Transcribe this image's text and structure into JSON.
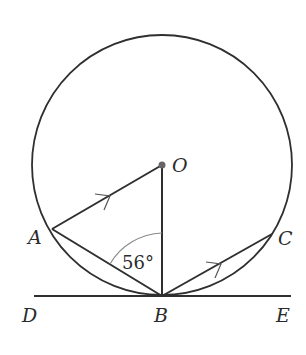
{
  "diagram": {
    "type": "circle-geometry",
    "circle": {
      "center_label": "O",
      "cx": 162,
      "cy": 165,
      "r": 130
    },
    "points": {
      "O": {
        "label": "O",
        "x": 162,
        "y": 165
      },
      "A": {
        "label": "A",
        "x": 52,
        "y": 229
      },
      "B": {
        "label": "B",
        "x": 162,
        "y": 296
      },
      "C": {
        "label": "C",
        "x": 272,
        "y": 234
      },
      "D": {
        "label": "D",
        "x": 34,
        "y": 296
      },
      "E": {
        "label": "E",
        "x": 291,
        "y": 296
      }
    },
    "segments": [
      "OA",
      "OB",
      "AB",
      "BC",
      "DE"
    ],
    "parallel_marks": [
      "AO",
      "BC"
    ],
    "tangent_line": "DE",
    "angle": {
      "at": "B",
      "between": [
        "A",
        "O"
      ],
      "value_label": "56°"
    },
    "colors": {
      "line": "#2f2f2f",
      "arc": "#8a8a8a",
      "dot": "#666666"
    }
  }
}
